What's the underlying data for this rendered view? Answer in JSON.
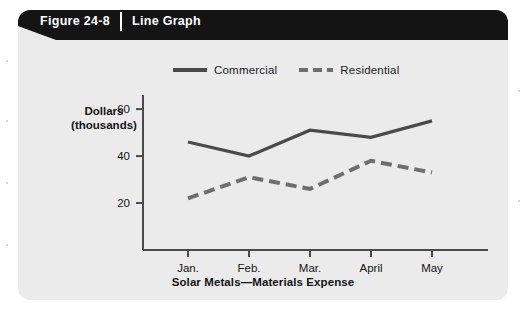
{
  "figure": {
    "number_label": "Figure 24-8",
    "type_label": "Line Graph"
  },
  "legend": {
    "position": "top-center",
    "entries": [
      {
        "label": "Commercial",
        "style": "solid",
        "color": "#4a4a4a"
      },
      {
        "label": "Residential",
        "style": "dashed",
        "color": "#6e6e6e"
      }
    ]
  },
  "axes": {
    "y_title_line1": "Dollars",
    "y_title_line2": "(thousands)",
    "y_ticks": [
      "20",
      "40",
      "60"
    ],
    "x_title": "Solar Metals—Materials Expense",
    "x_ticks": [
      "Jan.",
      "Feb.",
      "Mar.",
      "April",
      "May"
    ]
  },
  "chart_data": {
    "type": "line",
    "title": "Solar Metals—Materials Expense",
    "subtitle": "",
    "xlabel": "Solar Metals—Materials Expense",
    "ylabel": "Dollars (thousands)",
    "categories": [
      "Jan.",
      "Feb.",
      "Mar.",
      "April",
      "May"
    ],
    "series": [
      {
        "name": "Commercial",
        "style": "solid",
        "color": "#4a4a4a",
        "values": [
          46,
          40,
          51,
          48,
          55
        ]
      },
      {
        "name": "Residential",
        "style": "dashed",
        "color": "#6e6e6e",
        "values": [
          22,
          31,
          26,
          38,
          33
        ]
      }
    ],
    "ylim": [
      0,
      66
    ],
    "yticks": [
      20,
      40,
      60
    ],
    "grid": false,
    "legend_position": "top-center"
  }
}
